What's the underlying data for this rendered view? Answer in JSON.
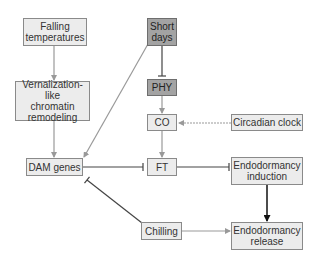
{
  "colors": {
    "light_fill": "#ececec",
    "dark_fill": "#a3a3a3",
    "activation_arrow": "#999999",
    "inhibition_line": "#444444",
    "strong_arrow": "#111111"
  },
  "nodes": {
    "falling_temperatures": "Falling\ntemperatures",
    "short_days": "Short\ndays",
    "vernalization": "Vernalization-like\nchromatin\nremodeling",
    "phy": "PHY",
    "co": "CO",
    "circadian_clock": "Circadian clock",
    "dam_genes": "DAM genes",
    "ft": "FT",
    "endodormancy_induction": "Endodormancy\ninduction",
    "chilling": "Chilling",
    "endodormancy_release": "Endodormancy\nrelease"
  },
  "edges": [
    {
      "from": "Falling temperatures",
      "to": "Vernalization-like chromatin remodeling",
      "type": "activation"
    },
    {
      "from": "Vernalization-like chromatin remodeling",
      "to": "DAM genes",
      "type": "activation"
    },
    {
      "from": "Short days",
      "to": "DAM genes",
      "type": "activation"
    },
    {
      "from": "Short days",
      "to": "PHY",
      "type": "inhibition"
    },
    {
      "from": "PHY",
      "to": "CO",
      "type": "activation"
    },
    {
      "from": "Circadian clock",
      "to": "CO",
      "type": "activation"
    },
    {
      "from": "CO",
      "to": "FT",
      "type": "activation"
    },
    {
      "from": "DAM genes",
      "to": "FT",
      "type": "inhibition"
    },
    {
      "from": "FT",
      "to": "Endodormancy induction",
      "type": "inhibition"
    },
    {
      "from": "Endodormancy induction",
      "to": "Endodormancy release",
      "type": "strong-activation"
    },
    {
      "from": "Chilling",
      "to": "Endodormancy release",
      "type": "activation"
    },
    {
      "from": "Chilling",
      "to": "DAM genes",
      "type": "inhibition"
    }
  ]
}
